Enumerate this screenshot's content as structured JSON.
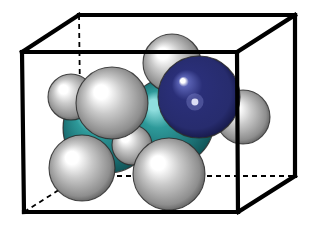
{
  "figure": {
    "kind": "space-filling-molecular-model",
    "background_color": "#ffffff",
    "width": 313,
    "height": 227
  },
  "box": {
    "name": "unit-cell-box",
    "edge_color": "#000000",
    "solid_edge_width": 4.2,
    "hidden_edge_width": 1.8,
    "hidden_edge_style": "dashed",
    "hidden_edge_dash": "5,4",
    "vertices": {
      "front_top_left": [
        22,
        52
      ],
      "front_top_right": [
        237,
        52
      ],
      "front_bottom_left": [
        24,
        212
      ],
      "front_bottom_right": [
        238,
        212
      ],
      "back_top_left": [
        79,
        15
      ],
      "back_top_right": [
        295,
        15
      ],
      "back_bottom_left": [
        81,
        176
      ],
      "back_bottom_right": [
        295,
        176
      ]
    },
    "solid_edges": [
      [
        "front_top_left",
        "front_top_right"
      ],
      [
        "front_top_left",
        "front_bottom_left"
      ],
      [
        "front_bottom_left",
        "front_bottom_right"
      ],
      [
        "front_bottom_right",
        "front_top_right"
      ],
      [
        "back_top_left",
        "back_top_right"
      ],
      [
        "back_top_right",
        "back_bottom_right"
      ],
      [
        "front_top_left",
        "back_top_left"
      ],
      [
        "front_top_right",
        "back_top_right"
      ],
      [
        "front_bottom_right",
        "back_bottom_right"
      ]
    ],
    "hidden_edges": [
      [
        "back_top_left",
        "back_bottom_left"
      ],
      [
        "back_bottom_left",
        "back_bottom_right"
      ],
      [
        "front_bottom_left",
        "back_bottom_left"
      ]
    ]
  },
  "palette": {
    "carbon_color": "#2e9a9a",
    "carbon_highlight": "#8fdede",
    "carbon_shadow": "#0d4a4d",
    "nitrogen_color": "#2a2f78",
    "nitrogen_highlight": "#ffffff",
    "nitrogen_shadow": "#0e1038",
    "hydrogen_color": "#c9c9c9",
    "hydrogen_highlight": "#ffffff",
    "hydrogen_shadow": "#4a4a4a",
    "outline_color": "#2b2b2b"
  },
  "legend": {
    "elements": [
      {
        "symbol": "C",
        "name": "carbon",
        "color": "#2e9a9a",
        "count": 2
      },
      {
        "symbol": "N",
        "name": "nitrogen",
        "color": "#2a2f78",
        "count": 1
      },
      {
        "symbol": "H",
        "name": "hydrogen",
        "color": "#c9c9c9",
        "count": 7
      }
    ]
  },
  "atoms": [
    {
      "id": "C1",
      "element": "C",
      "cx": 108,
      "cy": 128,
      "r": 45,
      "hx": 88,
      "hy": 108,
      "z": 1,
      "name": "atom-carbon-1"
    },
    {
      "id": "C2",
      "element": "C",
      "cx": 170,
      "cy": 122,
      "r": 44,
      "hx": 152,
      "hy": 103,
      "z": 2,
      "name": "atom-carbon-2"
    },
    {
      "id": "N1",
      "element": "N",
      "cx": 199,
      "cy": 97,
      "r": 41,
      "hx": 182,
      "hy": 80,
      "z": 3,
      "name": "atom-nitrogen-1"
    },
    {
      "id": "H1",
      "element": "H",
      "cx": 71,
      "cy": 97,
      "r": 23,
      "hx": 62,
      "hy": 88,
      "z": 4,
      "name": "atom-hydrogen-1"
    },
    {
      "id": "H2",
      "element": "H",
      "cx": 112,
      "cy": 103,
      "r": 36,
      "hx": 99,
      "hy": 90,
      "z": 7,
      "name": "atom-hydrogen-2"
    },
    {
      "id": "H3",
      "element": "H",
      "cx": 82,
      "cy": 168,
      "r": 33,
      "hx": 70,
      "hy": 156,
      "z": 6,
      "name": "atom-hydrogen-3"
    },
    {
      "id": "H4",
      "element": "H",
      "cx": 169,
      "cy": 174,
      "r": 36,
      "hx": 156,
      "hy": 161,
      "z": 6,
      "name": "atom-hydrogen-4"
    },
    {
      "id": "H5",
      "element": "H",
      "cx": 172,
      "cy": 63,
      "r": 29,
      "hx": 161,
      "hy": 52,
      "z": 2,
      "name": "atom-hydrogen-5"
    },
    {
      "id": "H6",
      "element": "H",
      "cx": 243,
      "cy": 117,
      "r": 27,
      "hx": 233,
      "hy": 107,
      "z": 2,
      "name": "atom-hydrogen-6"
    },
    {
      "id": "H7",
      "element": "H",
      "cx": 132,
      "cy": 145,
      "r": 20,
      "hx": 124,
      "hy": 137,
      "z": 5,
      "name": "atom-hydrogen-7"
    }
  ]
}
